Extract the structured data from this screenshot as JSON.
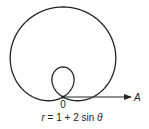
{
  "diagram": {
    "type": "polar-curve",
    "curve_name": "limacon-with-inner-loop",
    "equation": {
      "lhs": "r",
      "equals": " = 1 + 2 sin ",
      "var": "θ"
    },
    "pole_label": "0",
    "axis_label": "A",
    "params": {
      "a": 1,
      "b": 2
    },
    "colors": {
      "stroke": "#222222",
      "background": "#ffffff"
    }
  }
}
